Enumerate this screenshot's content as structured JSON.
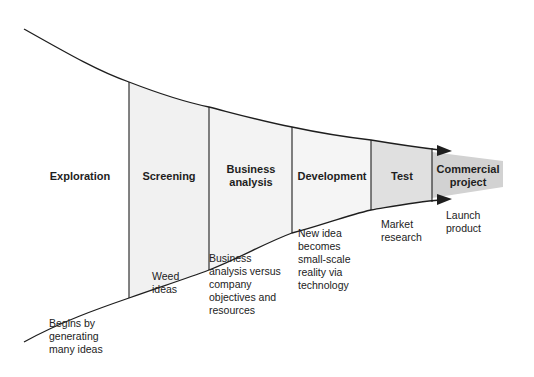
{
  "colors": {
    "line": "#1e1e1e",
    "light_fill": "#f1f1f1",
    "test_fill": "#e0e0e0",
    "commercial_fill": "#d2d2d2",
    "background": "#ffffff"
  },
  "stages": [
    {
      "label": "Exploration",
      "note": "Begins by generating many ideas"
    },
    {
      "label": "Screening",
      "note": "Weed ideas"
    },
    {
      "label": "Business analysis",
      "note": "Business analysis versus company objectives and resources"
    },
    {
      "label": "Development",
      "note": "New idea becomes small-scale reality via technology"
    },
    {
      "label": "Test",
      "note": "Market research"
    },
    {
      "label": "Commercial project",
      "note": "Launch product"
    }
  ],
  "labels": {
    "exploration": "Exploration",
    "screening": "Screening",
    "business_1": "Business",
    "business_2": "analysis",
    "development": "Development",
    "test": "Test",
    "commercial_1": "Commercial",
    "commercial_2": "project"
  },
  "notes": {
    "exploration": [
      "Begins by",
      "generating",
      "many ideas"
    ],
    "screening": [
      "Weed",
      "ideas"
    ],
    "business": [
      "Business",
      "analysis versus",
      "company",
      "objectives and",
      "resources"
    ],
    "development": [
      "New idea",
      "becomes",
      "small-scale",
      "reality via",
      "technology"
    ],
    "test": [
      "Market",
      "research"
    ],
    "commercial": [
      "Launch",
      "product"
    ]
  }
}
